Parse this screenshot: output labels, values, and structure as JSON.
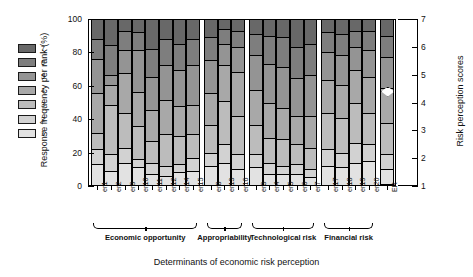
{
  "chart_data": {
    "type": "bar",
    "subtype": "stacked-percentage-column",
    "title": "",
    "xlabel": "Determinants of economic risk perception",
    "ylabel": "Response frequency per rank (%)",
    "y2label": "Risk perception scores",
    "ylim": [
      0,
      100
    ],
    "yticks": [
      0,
      20,
      40,
      60,
      80,
      100
    ],
    "y2lim": [
      1,
      7
    ],
    "y2ticks": [
      1,
      2,
      3,
      4,
      5,
      6,
      7
    ],
    "grid": false,
    "legend_position": "left-outside",
    "legend_title": "",
    "series": [
      {
        "name": "1",
        "color": "#e2e2e2"
      },
      {
        "name": "2",
        "color": "#d2d2d2"
      },
      {
        "name": "3",
        "color": "#bcbcbc"
      },
      {
        "name": "4",
        "color": "#a8a8a8"
      },
      {
        "name": "5",
        "color": "#949494"
      },
      {
        "name": "6",
        "color": "#7e7e7e"
      },
      {
        "name": "7",
        "color": "#686868"
      }
    ],
    "categories": [
      "er1",
      "er2",
      "er9",
      "er10",
      "er11",
      "er12",
      "er14",
      "er15",
      "er8",
      "er13",
      "er16",
      "er3",
      "er4",
      "er5",
      "er6",
      "er7",
      "er17",
      "er18",
      "er19",
      "er20",
      "ER"
    ],
    "groups": [
      {
        "label": "Economic opportunity",
        "categories": [
          "er1",
          "er2",
          "er9",
          "er10",
          "er11",
          "er12",
          "er14",
          "er15"
        ]
      },
      {
        "label": "Appropriability",
        "categories": [
          "er8",
          "er13",
          "er16"
        ]
      },
      {
        "label": "Technological risk",
        "categories": [
          "er3",
          "er4",
          "er5",
          "er6",
          "er7"
        ]
      },
      {
        "label": "Financial risk",
        "categories": [
          "er17",
          "er18",
          "er19",
          "er20"
        ]
      },
      {
        "label": "",
        "categories": [
          "ER"
        ]
      }
    ],
    "stacks": [
      {
        "category": "er1",
        "values": [
          12,
          9,
          10,
          24,
          21,
          12,
          12
        ]
      },
      {
        "category": "er2",
        "values": [
          8,
          10,
          30,
          12,
          6,
          18,
          16
        ]
      },
      {
        "category": "er9",
        "values": [
          13,
          9,
          21,
          24,
          14,
          12,
          7
        ]
      },
      {
        "category": "er10",
        "values": [
          10,
          5,
          20,
          21,
          25,
          11,
          8
        ]
      },
      {
        "category": "er11",
        "values": [
          6,
          7,
          13,
          19,
          20,
          17,
          18
        ]
      },
      {
        "category": "er12",
        "values": [
          5,
          6,
          19,
          21,
          21,
          16,
          12
        ]
      },
      {
        "category": "er14",
        "values": [
          7,
          5,
          17,
          18,
          22,
          16,
          15
        ]
      },
      {
        "category": "er15",
        "values": [
          8,
          8,
          14,
          18,
          24,
          16,
          12
        ]
      },
      {
        "category": "er8",
        "values": [
          11,
          8,
          17,
          19,
          20,
          14,
          11
        ]
      },
      {
        "category": "er13",
        "values": [
          13,
          11,
          26,
          22,
          13,
          9,
          6
        ]
      },
      {
        "category": "er16",
        "values": [
          9,
          9,
          23,
          27,
          15,
          10,
          7
        ]
      },
      {
        "category": "er3",
        "values": [
          10,
          8,
          18,
          21,
          21,
          13,
          9
        ]
      },
      {
        "category": "er4",
        "values": [
          6,
          7,
          15,
          21,
          24,
          17,
          10
        ]
      },
      {
        "category": "er5",
        "values": [
          6,
          5,
          16,
          19,
          25,
          18,
          11
        ]
      },
      {
        "category": "er6",
        "values": [
          6,
          6,
          12,
          17,
          23,
          19,
          17
        ]
      },
      {
        "category": "er7",
        "values": [
          4,
          5,
          13,
          19,
          25,
          19,
          15
        ]
      },
      {
        "category": "er17",
        "values": [
          11,
          10,
          22,
          20,
          17,
          12,
          8
        ]
      },
      {
        "category": "er18",
        "values": [
          10,
          9,
          21,
          20,
          18,
          13,
          9
        ]
      },
      {
        "category": "er19",
        "values": [
          13,
          12,
          24,
          20,
          14,
          10,
          7
        ]
      },
      {
        "category": "er20",
        "values": [
          14,
          10,
          19,
          22,
          16,
          12,
          7
        ]
      },
      {
        "category": "ER",
        "values": [
          9,
          9,
          19,
          21,
          19,
          13,
          10
        ]
      }
    ],
    "marker": {
      "category": "ER",
      "label": "",
      "score": 4.4,
      "shape": "diamond"
    }
  }
}
